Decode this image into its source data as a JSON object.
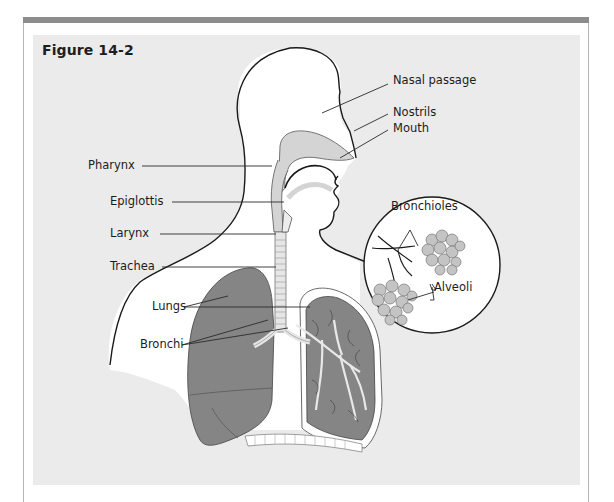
{
  "figure": {
    "title": "Figure 14-2"
  },
  "labels": {
    "nasal_passage": "Nasal passage",
    "nostrils": "Nostrils",
    "mouth": "Mouth",
    "pharynx": "Pharynx",
    "epiglottis": "Epiglottis",
    "larynx": "Larynx",
    "trachea": "Trachea",
    "lungs": "Lungs",
    "bronchi": "Bronchi",
    "bronchioles": "Bronchioles",
    "alveoli": "Alveoli"
  },
  "colors": {
    "frame_bar": "#8d8d8d",
    "panel": "#ebebeb",
    "body_fill": "#ffffff",
    "lung_fill": "#858585",
    "airway_fill": "#d4d4d4",
    "alveoli_fill": "#c4c4c4",
    "outline": "#1a1a1a"
  }
}
